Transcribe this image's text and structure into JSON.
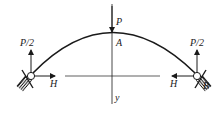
{
  "diagram": {
    "type": "three-hinged arch / two-hinged arch free-body diagram",
    "labels": {
      "load_top": "P",
      "apex": "A",
      "left_reaction_vertical": "P/2",
      "right_reaction_vertical": "P/2",
      "left_horizontal": "H",
      "right_horizontal": "H",
      "right_support": "B",
      "axis_y": "y"
    },
    "colors": {
      "stroke": "#1a1a1a",
      "background": "#ffffff"
    }
  }
}
